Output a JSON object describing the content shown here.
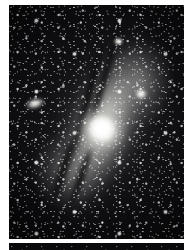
{
  "image": {
    "kind": "astrophotograph",
    "subject": "Andromeda Galaxy (M31) spiral galaxy with satellite galaxies",
    "palette": {
      "paper": "#ffffff",
      "sky": "#050506",
      "sky_mid": "#18181c",
      "nebulosity": "#c6c6c2",
      "core_highlight": "#ffffff",
      "dust_lane": "#08080a"
    },
    "frame": {
      "margin_left_px": 9,
      "margin_top_px": 5,
      "photo_width_px": 175,
      "photo_height_px": 234,
      "footer_strip_top_px": 243,
      "footer_strip_height_px": 7
    },
    "features": [
      {
        "id": "galaxy-core",
        "label": "M31 nucleus",
        "x": 97,
        "y": 122,
        "brightness": "saturated-white"
      },
      {
        "id": "galaxy-disk",
        "label": "M31 inclined disk",
        "x": 95,
        "y": 120,
        "position_angle_deg": 22
      },
      {
        "id": "dust-lanes",
        "label": "Dark dust lanes",
        "x": 82,
        "y": 95,
        "count": 4
      },
      {
        "id": "sat-m110",
        "label": "NGC 205 (M110)",
        "x": 26,
        "y": 99,
        "shape": "elongated-ellipse"
      },
      {
        "id": "sat-m32",
        "label": "NGC 221 (M32)",
        "x": 132,
        "y": 89,
        "shape": "compact-round"
      },
      {
        "id": "knot-ne",
        "label": "Bright knot, NE arm",
        "x": 110,
        "y": 37,
        "shape": "small-round"
      }
    ],
    "star_field": {
      "description": "Dense field of faint foreground stars across the whole frame",
      "density": "high",
      "layers": 3
    }
  }
}
